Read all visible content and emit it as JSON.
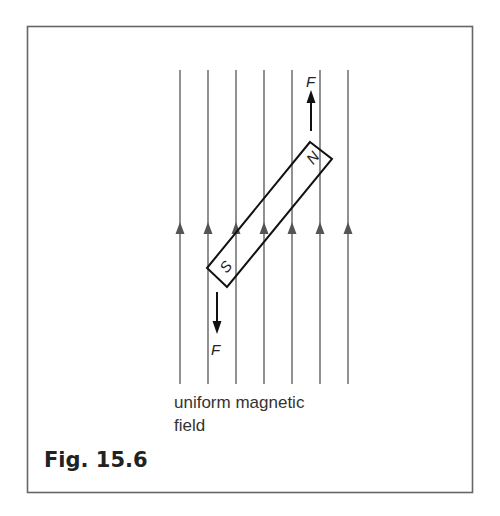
{
  "figure": {
    "caption": "Fig. 15.6",
    "field_label_line1": "uniform magnetic",
    "field_label_line2": "field",
    "force_label_top": "F",
    "force_label_bottom": "F",
    "magnet": {
      "north_label": "N",
      "south_label": "S"
    },
    "field_lines": {
      "count": 7,
      "x_positions": [
        180,
        208,
        236,
        264,
        292,
        320,
        348
      ],
      "direction": "up",
      "color": "#555555"
    },
    "frame_color": "#666666"
  }
}
